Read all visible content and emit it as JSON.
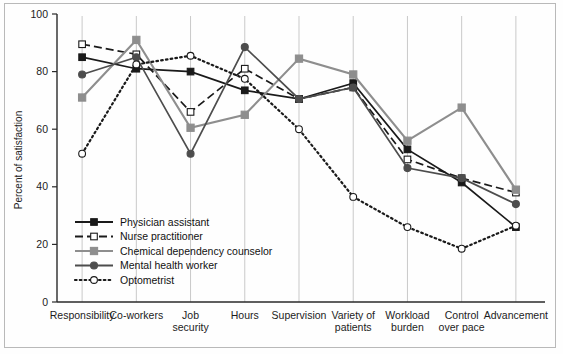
{
  "chart_data": {
    "type": "line",
    "title": "",
    "xlabel": "",
    "ylabel": "Percent of satisfaction",
    "ylim": [
      0,
      100
    ],
    "yticks": [
      0,
      20,
      40,
      60,
      80,
      100
    ],
    "ytick_labels": [
      "0",
      "20",
      "40",
      "60",
      "80",
      "100"
    ],
    "grid": "vertical",
    "legend_position": "inside-lower-left",
    "categories": [
      "Responsibility",
      "Co-workers",
      "Job security",
      "Hours",
      "Supervision",
      "Variety of patients",
      "Workload burden",
      "Control over pace",
      "Advancement"
    ],
    "category_label_lines": [
      [
        "Responsibility"
      ],
      [
        "Co-workers"
      ],
      [
        "Job",
        "security"
      ],
      [
        "Hours"
      ],
      [
        "Supervision"
      ],
      [
        "Variety of",
        "patients"
      ],
      [
        "Workload",
        "burden"
      ],
      [
        "Control",
        "over pace"
      ],
      [
        "Advancement"
      ]
    ],
    "series": [
      {
        "name": "Physician assistant",
        "color": "#1a1a1a",
        "marker": "filled-square",
        "dash": "solid",
        "values": [
          85,
          81,
          80,
          73.5,
          70.5,
          76,
          53,
          41.5,
          26
        ]
      },
      {
        "name": "Nurse practitioner",
        "color": "#1a1a1a",
        "marker": "open-square",
        "dash": "dashed",
        "values": [
          89.5,
          86,
          66,
          81,
          70.5,
          74.5,
          49.5,
          43,
          38
        ]
      },
      {
        "name": "Chemical dependency counselor",
        "color": "#8e8e8e",
        "marker": "filled-square-gray",
        "dash": "solid",
        "values": [
          71,
          91,
          60.5,
          65,
          84.5,
          79,
          56,
          67.5,
          39
        ]
      },
      {
        "name": "Mental health worker",
        "color": "#4d4d4d",
        "marker": "filled-circle",
        "dash": "solid",
        "values": [
          79,
          85,
          51.5,
          88.5,
          70.5,
          74.5,
          46.5,
          43,
          34
        ]
      },
      {
        "name": "Optometrist",
        "color": "#1a1a1a",
        "marker": "open-circle",
        "dash": "dotted",
        "values": [
          51.5,
          82.5,
          85.5,
          77.5,
          60,
          36.5,
          26,
          18.5,
          26.5
        ]
      }
    ],
    "legend": [
      {
        "label": "Physician assistant",
        "marker": "filled-square",
        "dash": "solid",
        "color": "#1a1a1a"
      },
      {
        "label": "Nurse practitioner",
        "marker": "open-square",
        "dash": "dashed",
        "color": "#1a1a1a"
      },
      {
        "label": "Chemical dependency counselor",
        "marker": "filled-square-gray",
        "dash": "solid",
        "color": "#8e8e8e"
      },
      {
        "label": "Mental health worker",
        "marker": "filled-circle",
        "dash": "solid",
        "color": "#4d4d4d"
      },
      {
        "label": "Optometrist",
        "marker": "open-circle",
        "dash": "dotted",
        "color": "#1a1a1a"
      }
    ]
  }
}
